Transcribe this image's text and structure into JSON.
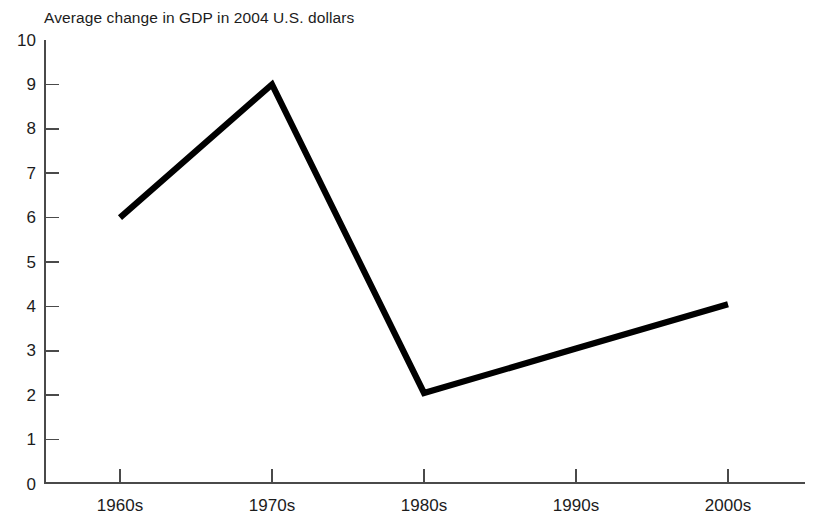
{
  "chart_data": {
    "type": "line",
    "title": "Average change in GDP in 2004 U.S. dollars",
    "xlabel": "",
    "ylabel": "",
    "categories": [
      "1960s",
      "1970s",
      "1980s",
      "1990s",
      "2000s"
    ],
    "values": [
      6.0,
      9.0,
      2.05,
      3.05,
      4.05
    ],
    "series": [
      {
        "name": "Average change in GDP",
        "values": [
          6.0,
          9.0,
          2.05,
          3.05,
          4.05
        ],
        "color": "#000000"
      }
    ],
    "ylim": [
      0,
      10
    ],
    "yticks": [
      0,
      1,
      2,
      3,
      4,
      5,
      6,
      7,
      8,
      9,
      10
    ],
    "ytick_labels": [
      "0",
      "1",
      "2",
      "3",
      "4",
      "5",
      "6",
      "7",
      "8",
      "9",
      "10"
    ],
    "xtick_labels": [
      "1960s",
      "1970s",
      "1980s",
      "1990s",
      "2000s"
    ],
    "grid": false,
    "legend": false,
    "markers": false,
    "line_color": "#000000",
    "axis_color": "#4a4a4a",
    "background": "#ffffff"
  }
}
